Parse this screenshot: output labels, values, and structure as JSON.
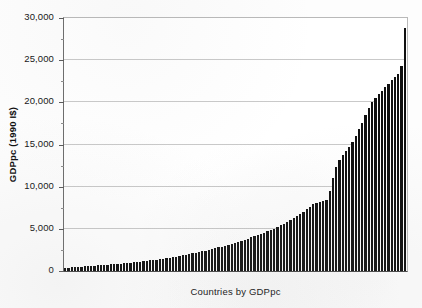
{
  "chart_data": {
    "type": "bar",
    "title": "",
    "subtitle": "",
    "xlabel": "Countries by GDPpc",
    "ylabel": "GDPpc (1990 I$)",
    "ylim": [
      0,
      30000
    ],
    "ytick_step": 5000,
    "yminor_step": 2500,
    "grid": true,
    "legend": null,
    "xticklabels": [],
    "yticklabels": [
      "0",
      "5,000",
      "10,000",
      "15,000",
      "20,000",
      "25,000",
      "30,000"
    ],
    "ytickvalues": [
      0,
      5000,
      10000,
      15000,
      20000,
      25000,
      30000
    ],
    "bar_color": "#101010",
    "n_bars": 105,
    "categories": [
      "c1",
      "c2",
      "c3",
      "c4",
      "c5",
      "c6",
      "c7",
      "c8",
      "c9",
      "c10",
      "c11",
      "c12",
      "c13",
      "c14",
      "c15",
      "c16",
      "c17",
      "c18",
      "c19",
      "c20",
      "c21",
      "c22",
      "c23",
      "c24",
      "c25",
      "c26",
      "c27",
      "c28",
      "c29",
      "c30",
      "c31",
      "c32",
      "c33",
      "c34",
      "c35",
      "c36",
      "c37",
      "c38",
      "c39",
      "c40",
      "c41",
      "c42",
      "c43",
      "c44",
      "c45",
      "c46",
      "c47",
      "c48",
      "c49",
      "c50",
      "c51",
      "c52",
      "c53",
      "c54",
      "c55",
      "c56",
      "c57",
      "c58",
      "c59",
      "c60",
      "c61",
      "c62",
      "c63",
      "c64",
      "c65",
      "c66",
      "c67",
      "c68",
      "c69",
      "c70",
      "c71",
      "c72",
      "c73",
      "c74",
      "c75",
      "c76",
      "c77",
      "c78",
      "c79",
      "c80",
      "c81",
      "c82",
      "c83",
      "c84",
      "c85",
      "c86",
      "c87",
      "c88",
      "c89",
      "c90",
      "c91",
      "c92",
      "c93",
      "c94",
      "c95",
      "c96",
      "c97",
      "c98",
      "c99",
      "c100",
      "c101",
      "c102",
      "c103",
      "c104",
      "c105"
    ],
    "values": [
      330,
      380,
      420,
      450,
      480,
      510,
      540,
      570,
      600,
      630,
      660,
      690,
      720,
      750,
      780,
      810,
      840,
      870,
      900,
      940,
      980,
      1020,
      1060,
      1100,
      1150,
      1200,
      1250,
      1300,
      1360,
      1420,
      1480,
      1540,
      1600,
      1660,
      1720,
      1790,
      1860,
      1930,
      2000,
      2080,
      2160,
      2240,
      2320,
      2400,
      2500,
      2600,
      2700,
      2800,
      2900,
      3000,
      3120,
      3240,
      3360,
      3480,
      3600,
      3720,
      3850,
      3980,
      4110,
      4250,
      4400,
      4550,
      4700,
      4850,
      5000,
      5200,
      5400,
      5600,
      5800,
      6000,
      6250,
      6500,
      6750,
      7000,
      7300,
      7600,
      7900,
      8100,
      8200,
      8300,
      8400,
      9500,
      11000,
      12300,
      13200,
      13700,
      14200,
      14700,
      15300,
      16000,
      16800,
      17600,
      18500,
      19300,
      20000,
      20500,
      21000,
      21400,
      21800,
      22200,
      22600,
      23000,
      23400,
      24300,
      28800
    ]
  }
}
